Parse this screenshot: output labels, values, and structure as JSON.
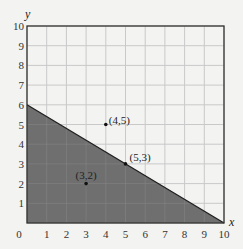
{
  "chart_data": {
    "type": "line",
    "title": "",
    "xlabel": "x",
    "ylabel": "y",
    "xlim": [
      0,
      10
    ],
    "ylim": [
      0,
      10
    ],
    "grid": true,
    "x_ticks": [
      "0",
      "1",
      "2",
      "3",
      "4",
      "5",
      "6",
      "7",
      "8",
      "9",
      "10"
    ],
    "y_ticks": [
      "1",
      "2",
      "3",
      "4",
      "5",
      "6",
      "7",
      "8",
      "9",
      "10"
    ],
    "line": {
      "description": "Boundary line through (0,6) and (10,0)",
      "points": [
        [
          0,
          6
        ],
        [
          10,
          0
        ]
      ],
      "shaded_region": "below line (region under boundary shaded dark gray)"
    },
    "points": [
      {
        "label": "(4,5)",
        "x": 4,
        "y": 5
      },
      {
        "label": "(5,3)",
        "x": 5,
        "y": 3
      },
      {
        "label": "(3,2)",
        "x": 3,
        "y": 2
      }
    ]
  },
  "colors": {
    "background": "#f3f3f1",
    "grid": "#c9c9c9",
    "frame": "#333333",
    "shade": "#6f6f6f",
    "line": "#1e1e1e"
  }
}
